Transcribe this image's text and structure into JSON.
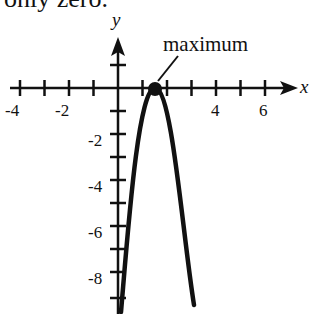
{
  "top_text": "only zero.",
  "graph": {
    "x_axis_label": "x",
    "y_axis_label": "y",
    "x_tick_labels": [
      {
        "value": -4,
        "label": "-4"
      },
      {
        "value": -2,
        "label": "-2"
      },
      {
        "value": 4,
        "label": "4"
      },
      {
        "value": 6,
        "label": "6"
      }
    ],
    "y_tick_labels": [
      {
        "value": -2,
        "label": "-2"
      },
      {
        "value": -4,
        "label": "-4"
      },
      {
        "value": -6,
        "label": "-6"
      },
      {
        "value": -8,
        "label": "-8"
      }
    ],
    "annotation": "maximum",
    "maximum_point": {
      "x": 1.5,
      "y": 0
    },
    "curve": "downward parabola with vertex at (1.5, 0)",
    "colors": {
      "ink": "#111111",
      "background": "#ffffff"
    }
  }
}
